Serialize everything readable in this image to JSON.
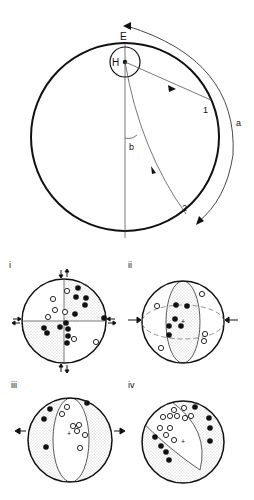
{
  "main_diagram": {
    "labels": {
      "E": "E",
      "H": "H",
      "point1": "1",
      "point2": "2",
      "arc_a": "a",
      "angle_b": "b"
    }
  },
  "panels": [
    {
      "id": "i",
      "label": "i"
    },
    {
      "id": "ii",
      "label": "ii"
    },
    {
      "id": "iii",
      "label": "iii"
    },
    {
      "id": "iv",
      "label": "iv"
    }
  ],
  "colors": {
    "line": "#111111",
    "thin_line": "#555555",
    "stipple": "#9a9a9a",
    "background": "#ffffff"
  }
}
